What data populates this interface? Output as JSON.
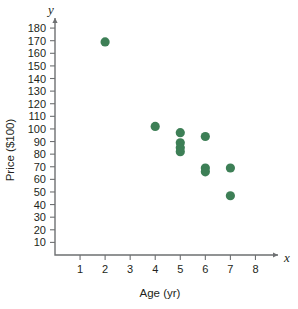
{
  "chart_data": {
    "type": "scatter",
    "title": "",
    "xlabel": "Age (yr)",
    "ylabel": "Price ($100)",
    "x_axis_letter": "x",
    "y_axis_letter": "y",
    "xlim": [
      0,
      8.9
    ],
    "ylim": [
      0,
      188
    ],
    "xticks": [
      1,
      2,
      3,
      4,
      5,
      6,
      7,
      8
    ],
    "yticks": [
      10,
      20,
      30,
      40,
      50,
      60,
      70,
      80,
      90,
      100,
      110,
      120,
      130,
      140,
      150,
      160,
      170,
      180
    ],
    "xtick_labels": [
      "1",
      "2",
      "3",
      "4",
      "5",
      "6",
      "7",
      "8"
    ],
    "ytick_labels": [
      "10",
      "20",
      "30",
      "40",
      "50",
      "60",
      "70",
      "80",
      "90",
      "100",
      "110",
      "120",
      "130",
      "140",
      "150",
      "160",
      "170",
      "180"
    ],
    "grid": false,
    "legend": null,
    "marker_color": "#3d7f56",
    "marker_size": 4.6,
    "points": [
      {
        "x": 2,
        "y": 169
      },
      {
        "x": 4,
        "y": 102
      },
      {
        "x": 5,
        "y": 97
      },
      {
        "x": 5,
        "y": 89
      },
      {
        "x": 5,
        "y": 85
      },
      {
        "x": 5,
        "y": 82
      },
      {
        "x": 6,
        "y": 94
      },
      {
        "x": 6,
        "y": 69
      },
      {
        "x": 6,
        "y": 66
      },
      {
        "x": 7,
        "y": 69
      },
      {
        "x": 7,
        "y": 47
      }
    ]
  },
  "colors": {
    "marker": "#3d7f56",
    "axis": "#6e7072",
    "text": "#231f20",
    "background": "#ffffff"
  }
}
